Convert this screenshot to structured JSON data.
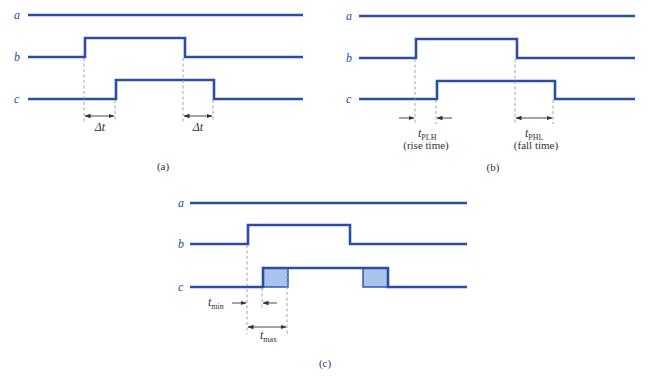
{
  "figure": {
    "colors": {
      "signal": "#2a4ea6",
      "shade": "#a9c3ec",
      "dash": "#9a9a9a",
      "text": "#333333"
    },
    "panels": [
      {
        "caption": "(a)",
        "signals": {
          "a": "a",
          "b": "b",
          "c": "c"
        },
        "annotations": {
          "delay_left": "Δt",
          "delay_right": "Δt"
        }
      },
      {
        "caption": "(b)",
        "signals": {
          "a": "a",
          "b": "b",
          "c": "c"
        },
        "annotations": {
          "rise_symbol": "t",
          "rise_sub": "PLH",
          "rise_desc": "(rise time)",
          "fall_symbol": "t",
          "fall_sub": "PHL",
          "fall_desc": "(fall time)"
        }
      },
      {
        "caption": "(c)",
        "signals": {
          "a": "a",
          "b": "b",
          "c": "c"
        },
        "annotations": {
          "min_symbol": "t",
          "min_sub": "min",
          "max_symbol": "t",
          "max_sub": "max"
        }
      }
    ]
  }
}
